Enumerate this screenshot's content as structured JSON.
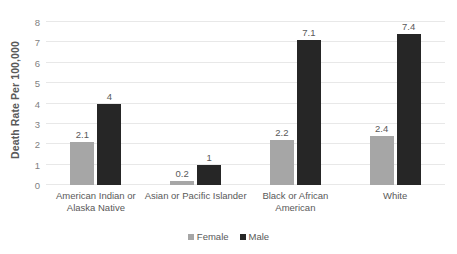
{
  "chart_data": {
    "type": "bar",
    "title": "",
    "subtitle": "",
    "xlabel": "",
    "ylabel": "Death Rate Per 100,000",
    "ylim": [
      0,
      8
    ],
    "ytick_labels": [
      "0",
      "1",
      "2",
      "3",
      "4",
      "5",
      "6",
      "7",
      "8"
    ],
    "ytick_values": [
      0,
      1,
      2,
      3,
      4,
      5,
      6,
      7,
      8
    ],
    "grid": true,
    "legend_position": "bottom-center",
    "categories": [
      "American Indian or Alaska Native",
      "Asian or Pacific Islander",
      "Black or African American",
      "White"
    ],
    "series": [
      {
        "name": "Female",
        "color": "#a6a6a6",
        "values": [
          2.1,
          0.2,
          2.2,
          2.4
        ],
        "labels": [
          "2.1",
          "0.2",
          "2.2",
          "2.4"
        ]
      },
      {
        "name": "Male",
        "color": "#262626",
        "values": [
          4,
          1,
          7.1,
          7.4
        ],
        "labels": [
          "4",
          "1",
          "7.1",
          "7.4"
        ]
      }
    ]
  },
  "legend": {
    "items": [
      {
        "label": "Female"
      },
      {
        "label": "Male"
      }
    ]
  }
}
